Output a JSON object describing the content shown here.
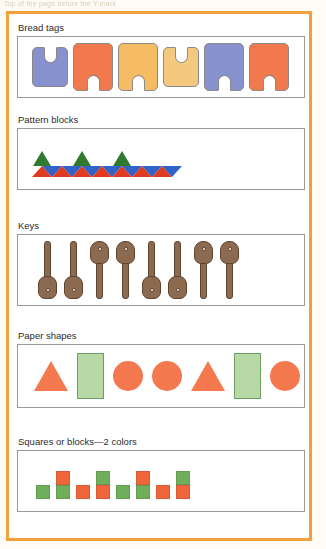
{
  "page": {
    "top_caption": "Top of the page before the Y mark",
    "frame_color": "#f0a13c",
    "background": "#ffffff"
  },
  "sections": [
    {
      "id": "bread-tags",
      "label": "Bread tags",
      "items": [
        {
          "name": "bread-tag",
          "color": "#8791cd",
          "notch": "up",
          "width": 36,
          "height": 40
        },
        {
          "name": "bread-tag",
          "color": "#f2794d",
          "notch": "down",
          "width": 40,
          "height": 48
        },
        {
          "name": "bread-tag",
          "color": "#f5bc63",
          "notch": "down",
          "width": 40,
          "height": 48
        },
        {
          "name": "bread-tag",
          "color": "#f5c87f",
          "notch": "up",
          "width": 36,
          "height": 40
        },
        {
          "name": "bread-tag",
          "color": "#8791cd",
          "notch": "down",
          "width": 40,
          "height": 48
        },
        {
          "name": "bread-tag",
          "color": "#f2794d",
          "notch": "down",
          "width": 40,
          "height": 48
        }
      ]
    },
    {
      "id": "pattern-blocks",
      "label": "Pattern blocks",
      "colors": {
        "red": "#e03b20",
        "blue": "#2f63c7",
        "green": "#2f7a2f"
      },
      "strip": [
        "red",
        "blue",
        "red",
        "blue",
        "red",
        "blue",
        "red",
        "blue",
        "red",
        "blue",
        "red",
        "blue",
        "red",
        "blue"
      ],
      "green_triangle_positions": [
        0,
        4,
        8
      ]
    },
    {
      "id": "keys",
      "label": "Keys",
      "color": "#8b6a4f",
      "items": [
        {
          "name": "key",
          "orientation": "up"
        },
        {
          "name": "key",
          "orientation": "up"
        },
        {
          "name": "key",
          "orientation": "down"
        },
        {
          "name": "key",
          "orientation": "down"
        },
        {
          "name": "key",
          "orientation": "up"
        },
        {
          "name": "key",
          "orientation": "up"
        },
        {
          "name": "key",
          "orientation": "down"
        },
        {
          "name": "key",
          "orientation": "down"
        }
      ]
    },
    {
      "id": "paper-shapes",
      "label": "Paper shapes",
      "colors": {
        "orange": "#f5794e",
        "green": "#b6d9a6"
      },
      "items": [
        {
          "name": "paper-shape-triangle",
          "shape": "triangle",
          "color": "#f5794e"
        },
        {
          "name": "paper-shape-rectangle",
          "shape": "rectangle",
          "color": "#b6d9a6"
        },
        {
          "name": "paper-shape-circle",
          "shape": "circle",
          "color": "#f5794e"
        },
        {
          "name": "paper-shape-circle",
          "shape": "circle",
          "color": "#f5794e"
        },
        {
          "name": "paper-shape-triangle",
          "shape": "triangle",
          "color": "#f5794e"
        },
        {
          "name": "paper-shape-rectangle",
          "shape": "rectangle",
          "color": "#b6d9a6"
        },
        {
          "name": "paper-shape-circle",
          "shape": "circle",
          "color": "#f5794e"
        },
        {
          "name": "paper-shape-circle",
          "shape": "circle",
          "color": "#f5794e"
        }
      ]
    },
    {
      "id": "squares-blocks",
      "label": "Squares or blocks—2 colors",
      "colors": {
        "green": "#6fae5a",
        "orange": "#f0663a"
      },
      "stacks": [
        [
          "green"
        ],
        [
          "orange",
          "green"
        ],
        [
          "orange"
        ],
        [
          "green",
          "orange"
        ],
        [
          "green"
        ],
        [
          "orange",
          "green"
        ],
        [
          "orange"
        ],
        [
          "green",
          "orange"
        ]
      ]
    }
  ]
}
